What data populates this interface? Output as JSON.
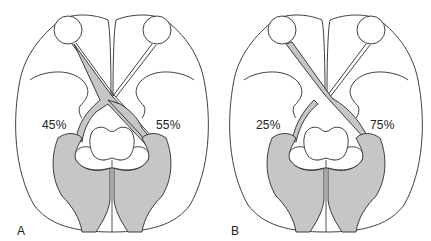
{
  "figure": {
    "colors": {
      "outline": "#2a2a2a",
      "shading": "#c6c6c6",
      "background": "#ffffff"
    },
    "panels": [
      {
        "label": "A",
        "left_percent": "45%",
        "right_percent": "55%"
      },
      {
        "label": "B",
        "left_percent": "25%",
        "right_percent": "75%"
      }
    ]
  }
}
